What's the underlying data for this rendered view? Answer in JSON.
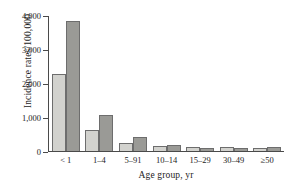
{
  "chart_data": {
    "type": "bar",
    "title": "",
    "xlabel": "Age group, yr",
    "ylabel": "Incidence rates/100,000",
    "categories": [
      "< 1",
      "1–4",
      "5–91",
      "10–14",
      "15–29",
      "30–49",
      "≥50"
    ],
    "series": [
      {
        "name": "series-1",
        "color": "#d2d2ce",
        "values": [
          2280,
          630,
          240,
          160,
          110,
          120,
          95
        ]
      },
      {
        "name": "series-2",
        "color": "#9a9a96",
        "values": [
          3850,
          1060,
          410,
          185,
          90,
          90,
          115
        ]
      }
    ],
    "ylim": [
      0,
      4000
    ],
    "yticks": [
      0,
      1000,
      2000,
      3000,
      4000
    ],
    "ytick_labels": [
      "0",
      "1,000",
      "2,000",
      "3,000",
      "4,000"
    ],
    "grid": false,
    "legend": "none"
  },
  "axes": {
    "y_title": "Incidence rates/100,000",
    "x_title": "Age group, yr"
  }
}
